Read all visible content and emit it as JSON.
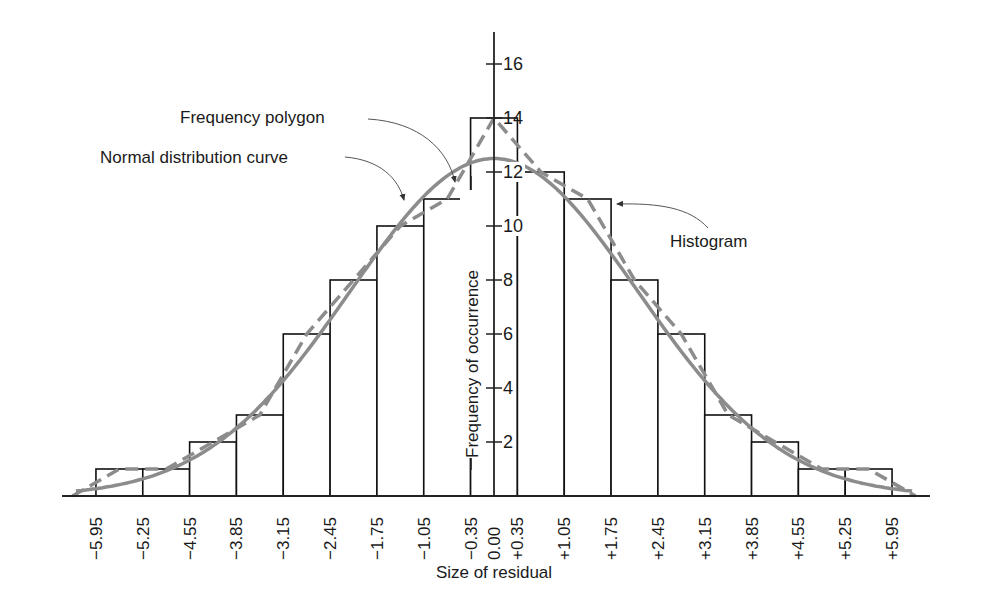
{
  "chart_data": {
    "type": "bar",
    "subtype": "histogram with frequency polygon and normal distribution curve",
    "title": "",
    "xlabel": "Size of residual",
    "ylabel": "Frequency of occurrence",
    "bin_edges": [
      -5.95,
      -5.25,
      -4.55,
      -3.85,
      -3.15,
      -2.45,
      -1.75,
      -1.05,
      -0.35,
      0.35,
      1.05,
      1.75,
      2.45,
      3.15,
      3.85,
      4.55,
      5.25,
      5.95
    ],
    "categories": [
      "-5.95 to -5.25",
      "-5.25 to -4.55",
      "-4.55 to -3.85",
      "-3.85 to -3.15",
      "-3.15 to -2.45",
      "-2.45 to -1.75",
      "-1.75 to -1.05",
      "-1.05 to -0.35",
      "-0.35 to +0.35",
      "+0.35 to +1.05",
      "+1.05 to +1.75",
      "+1.75 to +2.45",
      "+2.45 to +3.15",
      "+3.15 to +3.85",
      "+3.85 to +4.55",
      "+4.55 to +5.25",
      "+5.25 to +5.95"
    ],
    "values": [
      1,
      1,
      2,
      3,
      6,
      8,
      10,
      11,
      14,
      12,
      11,
      8,
      6,
      3,
      2,
      1,
      1
    ],
    "series": [
      {
        "name": "Histogram",
        "style": "black outlined bars",
        "values": [
          1,
          1,
          2,
          3,
          6,
          8,
          10,
          11,
          14,
          12,
          11,
          8,
          6,
          3,
          2,
          1,
          1
        ]
      },
      {
        "name": "Frequency polygon",
        "style": "gray dashed line through bin midpoints",
        "values": [
          1,
          1,
          2,
          3,
          6,
          8,
          10,
          11,
          14,
          12,
          11,
          8,
          6,
          3,
          2,
          1,
          1
        ]
      },
      {
        "name": "Normal distribution curve",
        "style": "gray solid smooth curve",
        "peak": 12.5,
        "mean": 0,
        "sigma": 2.15
      }
    ],
    "x_tick_labels": [
      "−5.95",
      "−5.25",
      "−4.55",
      "−3.85",
      "−3.15",
      "−2.45",
      "−1.75",
      "−1.05",
      "−0.35",
      "0.00",
      "+0.35",
      "+1.05",
      "+1.75",
      "+2.45",
      "+3.15",
      "+3.85",
      "+4.55",
      "+5.25",
      "+5.95"
    ],
    "x_tick_values": [
      -5.95,
      -5.25,
      -4.55,
      -3.85,
      -3.15,
      -2.45,
      -1.75,
      -1.05,
      -0.35,
      0.0,
      0.35,
      1.05,
      1.75,
      2.45,
      3.15,
      3.85,
      4.55,
      5.25,
      5.95
    ],
    "y_ticks": [
      2,
      4,
      6,
      8,
      10,
      12,
      14,
      16
    ],
    "ylim": [
      0,
      17.5
    ],
    "xlim": [
      -6.3,
      6.3
    ],
    "grid": false,
    "legend": "none (callout annotations)",
    "annotations": [
      {
        "text": "Frequency polygon",
        "points_to": "dashed polygon near -0.7"
      },
      {
        "text": "Normal distribution curve",
        "points_to": "solid curve near -1.4"
      },
      {
        "text": "Histogram",
        "points_to": "bar +1.05 to +1.75 top-right corner"
      }
    ],
    "colors": {
      "bars": "#000000",
      "polygon": "#8c8c8c",
      "normal_curve": "#8c8c8c",
      "text": "#1a1a1a"
    }
  }
}
